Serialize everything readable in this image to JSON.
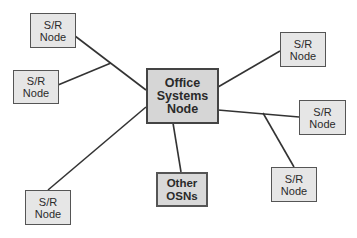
{
  "diagram": {
    "nodes": [
      {
        "id": "sr-top-left",
        "lines": [
          "S/R",
          "Node"
        ]
      },
      {
        "id": "sr-mid-left",
        "lines": [
          "S/R",
          "Node"
        ]
      },
      {
        "id": "sr-bottom-left",
        "lines": [
          "S/R",
          "Node"
        ]
      },
      {
        "id": "office-systems-node",
        "lines": [
          "Office",
          "Systems",
          "Node"
        ]
      },
      {
        "id": "other-osns",
        "lines": [
          "Other",
          "OSNs"
        ]
      },
      {
        "id": "sr-top-right",
        "lines": [
          "S/R",
          "Node"
        ]
      },
      {
        "id": "sr-mid-right",
        "lines": [
          "S/R",
          "Node"
        ]
      },
      {
        "id": "sr-bottom-right",
        "lines": [
          "S/R",
          "Node"
        ]
      }
    ],
    "edges": [
      {
        "from": "sr-top-left",
        "to": "office-systems-node"
      },
      {
        "from": "sr-mid-left",
        "to": "office-systems-node",
        "via": "junction-left"
      },
      {
        "from": "sr-bottom-left",
        "to": "office-systems-node"
      },
      {
        "from": "office-systems-node",
        "to": "sr-top-right"
      },
      {
        "from": "office-systems-node",
        "to": "sr-mid-right"
      },
      {
        "from": "sr-bottom-right",
        "to": "office-systems-node",
        "via": "junction-right"
      },
      {
        "from": "office-systems-node",
        "to": "other-osns"
      }
    ],
    "colors": {
      "node_fill": "#e6e6e6",
      "main_fill": "#d6d6d6",
      "border": "#555555",
      "line": "#333333"
    }
  }
}
